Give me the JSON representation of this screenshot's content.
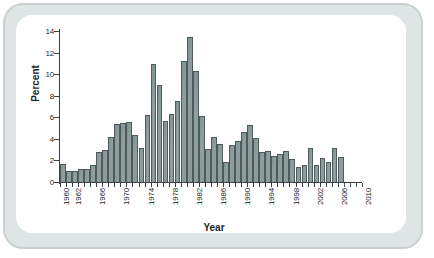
{
  "figure": {
    "frame_color": "#c9d2d2",
    "card_color": "#ffffff",
    "bar_fill": "#8a9b9a",
    "bar_stroke": "#4e5a5c",
    "axis_color": "#3b4043"
  },
  "chart_data": {
    "type": "bar",
    "title": "",
    "xlabel": "Year",
    "ylabel": "Percent",
    "ylim": [
      0,
      14
    ],
    "xlim": [
      1960,
      2011
    ],
    "grid": false,
    "legend": null,
    "y_ticks": [
      0,
      2,
      4,
      6,
      8,
      10,
      12,
      14
    ],
    "y_tick_labels": [
      "0",
      "2",
      "4",
      "6",
      "8",
      "10",
      "12",
      "14"
    ],
    "x_tick_labels": [
      "1960",
      "1962",
      "1966",
      "1970",
      "1974",
      "1978",
      "1982",
      "1986",
      "1990",
      "1994",
      "1998",
      "2002",
      "2006",
      "2010"
    ],
    "x_tick_label_years": [
      1960,
      1962,
      1966,
      1970,
      1974,
      1978,
      1982,
      1986,
      1990,
      1994,
      1998,
      2002,
      2006,
      2010
    ],
    "x_minor_tick_years": [
      1960,
      1961,
      1962,
      1963,
      1964,
      1965,
      1966,
      1967,
      1968,
      1969,
      1970,
      1971,
      1972,
      1973,
      1974,
      1975,
      1976,
      1977,
      1978,
      1979,
      1980,
      1981,
      1982,
      1983,
      1984,
      1985,
      1986,
      1987,
      1988,
      1989,
      1990,
      1991,
      1992,
      1993,
      1994,
      1995,
      1996,
      1997,
      1998,
      1999,
      2000,
      2001,
      2002,
      2003,
      2004,
      2005,
      2006,
      2007,
      2008,
      2009,
      2010
    ],
    "axis_line_end_year": 2006,
    "categories": [
      1960,
      1961,
      1962,
      1963,
      1964,
      1965,
      1966,
      1967,
      1968,
      1969,
      1970,
      1971,
      1972,
      1973,
      1974,
      1975,
      1976,
      1977,
      1978,
      1979,
      1980,
      1981,
      1982,
      1983,
      1984,
      1985,
      1986,
      1987,
      1988,
      1989,
      1990,
      1991,
      1992,
      1993,
      1994,
      1995,
      1996,
      1997,
      1998,
      1999,
      2000,
      2001,
      2002,
      2003,
      2004,
      2005
    ],
    "values": [
      1.7,
      1.0,
      1.0,
      1.25,
      1.2,
      1.55,
      2.8,
      3.0,
      4.15,
      5.35,
      5.45,
      5.6,
      4.35,
      3.15,
      6.2,
      10.9,
      9.0,
      5.7,
      6.35,
      7.5,
      11.2,
      13.45,
      10.25,
      6.1,
      3.05,
      4.2,
      3.55,
      1.85,
      3.45,
      3.8,
      4.65,
      5.25,
      4.1,
      2.8,
      2.85,
      2.45,
      2.6,
      2.85,
      2.15,
      1.4,
      1.55,
      3.2,
      1.6,
      2.25,
      1.85,
      3.2
    ],
    "extra_trailing_value": 2.35,
    "extra_trailing_year": 2006
  }
}
